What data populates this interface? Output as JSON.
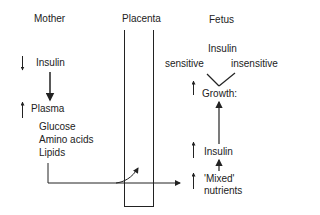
{
  "columns": {
    "mother": "Mother",
    "placenta": "Placenta",
    "fetus": "Fetus"
  },
  "mother": {
    "insulin": "Insulin",
    "insulin_change": "down",
    "plasma": "Plasma",
    "plasma_change": "up",
    "nutrients": [
      "Glucose",
      "Amino acids",
      "Lipids"
    ]
  },
  "fetus": {
    "insulin_top": "Insulin",
    "sensitive": "sensitive",
    "insensitive": "insensitive",
    "growth": "Growth:",
    "growth_change": "up",
    "insulin": "Insulin",
    "insulin_change": "up",
    "mixed_nutrients_1": "'Mixed'",
    "mixed_nutrients_2": "nutrients",
    "mixed_change": "up"
  }
}
